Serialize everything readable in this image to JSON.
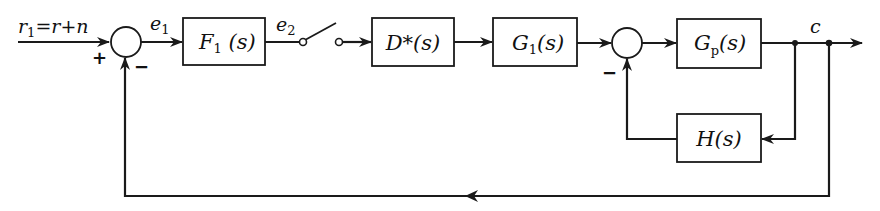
{
  "diagram": {
    "type": "control-system-block-diagram",
    "input": {
      "label_main": "r",
      "label_sub": "1",
      "label_rest": "=r+n"
    },
    "signals": {
      "e1": {
        "main": "e",
        "sub": "1"
      },
      "e2": {
        "main": "e",
        "sub": "2"
      },
      "output": {
        "main": "c"
      }
    },
    "blocks": [
      {
        "id": "F1",
        "main": "F",
        "sub": "1",
        "rest": " (s)"
      },
      {
        "id": "Dstar",
        "main": "D*(s)"
      },
      {
        "id": "G1",
        "main": "G",
        "sub": "1",
        "rest": "(s)"
      },
      {
        "id": "Gp",
        "main": "G",
        "sub": "p",
        "rest": "(s)"
      },
      {
        "id": "H",
        "main": "H(s)"
      }
    ],
    "summing_junctions": [
      {
        "id": "sum1",
        "signs": {
          "plus": "+",
          "minus": "−"
        }
      },
      {
        "id": "sum2",
        "signs": {
          "minus": "−"
        }
      }
    ],
    "sampler": {
      "type": "switch"
    },
    "feedback_loops": [
      {
        "from": "c",
        "through": "H(s)",
        "to": "sum2",
        "sign": "negative"
      },
      {
        "from": "c",
        "through": "unity",
        "to": "sum1",
        "sign": "negative"
      }
    ]
  }
}
